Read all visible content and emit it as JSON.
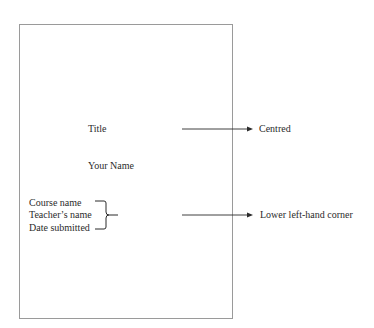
{
  "page": {
    "title_label": "Title",
    "name_label": "Your Name",
    "info_lines": [
      "Course name",
      "Teacher’s name",
      "Date submitted"
    ]
  },
  "annotations": {
    "title_note": "Centred",
    "info_note": "Lower left-hand corner"
  },
  "colors": {
    "border": "#9a9a9a",
    "text": "#2b2b2b",
    "arrow": "#2b2b2b"
  }
}
